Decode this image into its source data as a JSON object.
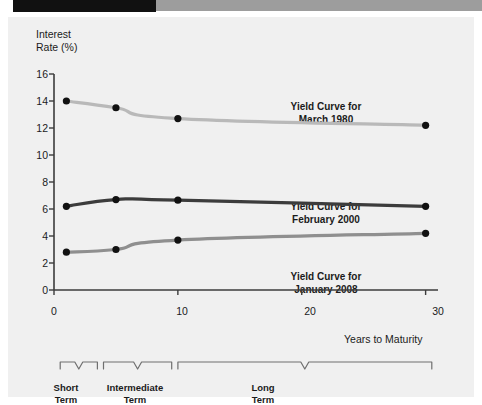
{
  "decor": {
    "black_bar": "black-bar",
    "gray_bar": "gray-bar"
  },
  "chart_data": {
    "type": "line",
    "title": "",
    "xlabel": "Years to Maturity",
    "ylabel": "Interest Rate (%)",
    "x": [
      1,
      5,
      10,
      30
    ],
    "xlim": [
      0,
      31
    ],
    "ylim": [
      0,
      16
    ],
    "xticks": [
      "0",
      "10",
      "20",
      "30"
    ],
    "xtick_values": [
      0,
      10,
      20,
      30
    ],
    "yticks": [
      "0",
      "2",
      "4",
      "6",
      "8",
      "10",
      "12",
      "14",
      "16"
    ],
    "ytick_values": [
      0,
      2,
      4,
      6,
      8,
      10,
      12,
      14,
      16
    ],
    "grid": false,
    "legend_position": "inline-annotations",
    "series": [
      {
        "name": "Yield Curve for March 1980",
        "label_line1": "Yield Curve for",
        "label_line2": "March 1980",
        "color": "#b9b9b9",
        "values": [
          14.0,
          13.5,
          12.7,
          12.2
        ]
      },
      {
        "name": "Yield Curve for February 2000",
        "label_line1": "Yield Curve for",
        "label_line2": "February 2000",
        "color": "#3c3c3c",
        "values": [
          6.2,
          6.7,
          6.65,
          6.2
        ]
      },
      {
        "name": "Yield Curve for January 2008",
        "label_line1": "Yield Curve for",
        "label_line2": "January 2008",
        "color": "#8f8f8f",
        "values": [
          2.8,
          3.0,
          3.7,
          4.2
        ]
      }
    ],
    "annotations": [
      {
        "text_line1": "Short",
        "text_line2": "Term",
        "range": [
          0.5,
          3.5
        ]
      },
      {
        "text_line1": "Intermediate",
        "text_line2": "Term",
        "range": [
          4.0,
          9.5
        ]
      },
      {
        "text_line1": "Long",
        "text_line2": "Term",
        "range": [
          10.0,
          30.5
        ]
      }
    ],
    "marker_color": "#111111",
    "axis_color": "#3c3c3c",
    "background": "#f0f0f0"
  }
}
